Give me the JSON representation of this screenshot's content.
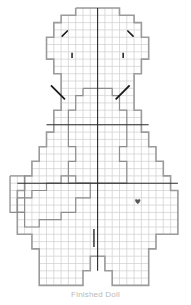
{
  "chart_data": {
    "type": "table",
    "subtitle": "",
    "xlabel": "",
    "ylabel": "",
    "grid": true,
    "legend_position": "none",
    "cell_width": 7.3,
    "cell_height": 7.3,
    "origin_x": 10.0,
    "origin_y": 8.0,
    "columns": 24,
    "rows": 40,
    "grid_line_color": "#cfcfcf",
    "outline_color": "#9b9b9b",
    "inner_line_color": "#8d8d8d",
    "symbol_color": "#1a1a1a",
    "heart_color": "#555555",
    "background_color": "#ffffff",
    "outlines": [
      {
        "name": "body-outline",
        "stroke": "#9b9b9b",
        "stroke_width": 1.6,
        "points": [
          [
            9,
            0
          ],
          [
            15,
            0
          ],
          [
            15,
            1
          ],
          [
            17,
            1
          ],
          [
            17,
            2
          ],
          [
            18,
            2
          ],
          [
            18,
            4
          ],
          [
            19,
            4
          ],
          [
            19,
            7
          ],
          [
            18,
            7
          ],
          [
            18,
            9
          ],
          [
            17,
            9
          ],
          [
            17,
            14
          ],
          [
            18,
            14
          ],
          [
            18,
            17
          ],
          [
            19,
            17
          ],
          [
            19,
            19
          ],
          [
            20,
            19
          ],
          [
            20,
            21
          ],
          [
            21,
            21
          ],
          [
            21,
            23
          ],
          [
            22,
            23
          ],
          [
            22,
            25
          ],
          [
            23,
            25
          ],
          [
            23,
            31
          ],
          [
            20,
            31
          ],
          [
            20,
            33
          ],
          [
            19,
            33
          ],
          [
            19,
            38
          ],
          [
            14,
            38
          ],
          [
            14,
            36
          ],
          [
            13,
            36
          ],
          [
            13,
            34
          ],
          [
            11,
            34
          ],
          [
            11,
            36
          ],
          [
            10,
            36
          ],
          [
            10,
            38
          ],
          [
            4,
            38
          ],
          [
            4,
            33
          ],
          [
            3,
            33
          ],
          [
            3,
            31
          ],
          [
            1,
            31
          ],
          [
            1,
            25
          ],
          [
            2,
            25
          ],
          [
            2,
            23
          ],
          [
            3,
            23
          ],
          [
            3,
            21
          ],
          [
            4,
            21
          ],
          [
            4,
            19
          ],
          [
            5,
            19
          ],
          [
            5,
            17
          ],
          [
            6,
            17
          ],
          [
            6,
            14
          ],
          [
            7,
            14
          ],
          [
            7,
            9
          ],
          [
            6,
            9
          ],
          [
            6,
            7
          ],
          [
            5,
            7
          ],
          [
            5,
            4
          ],
          [
            6,
            4
          ],
          [
            6,
            2
          ],
          [
            7,
            2
          ],
          [
            7,
            1
          ],
          [
            9,
            1
          ],
          [
            9,
            0
          ]
        ]
      },
      {
        "name": "inner-neck-outline",
        "stroke": "#8d8d8d",
        "stroke_width": 1.2,
        "points": [
          [
            10,
            11
          ],
          [
            14,
            11
          ],
          [
            14,
            12
          ],
          [
            15,
            12
          ],
          [
            15,
            14
          ],
          [
            16,
            14
          ],
          [
            16,
            19
          ],
          [
            15,
            19
          ],
          [
            15,
            21
          ],
          [
            16,
            21
          ],
          [
            16,
            24
          ],
          [
            8,
            24
          ],
          [
            8,
            21
          ],
          [
            9,
            21
          ],
          [
            9,
            19
          ],
          [
            8,
            19
          ],
          [
            8,
            14
          ],
          [
            9,
            14
          ],
          [
            9,
            12
          ],
          [
            10,
            12
          ],
          [
            10,
            11
          ]
        ]
      },
      {
        "name": "lower-left-notch-outline",
        "stroke": "#8d8d8d",
        "stroke_width": 1.2,
        "points": [
          [
            0,
            23
          ],
          [
            2,
            23
          ],
          [
            2,
            28
          ],
          [
            0,
            28
          ],
          [
            0,
            23
          ]
        ]
      },
      {
        "name": "inner-lower-outline",
        "stroke": "#8d8d8d",
        "stroke_width": 1.2,
        "points": [
          [
            1,
            26
          ],
          [
            3,
            26
          ],
          [
            3,
            25
          ],
          [
            5,
            25
          ],
          [
            5,
            24
          ],
          [
            7,
            24
          ],
          [
            7,
            23
          ],
          [
            9,
            23
          ],
          [
            9,
            24
          ],
          [
            11,
            24
          ],
          [
            11,
            26
          ],
          [
            9,
            26
          ],
          [
            9,
            28
          ],
          [
            7,
            28
          ],
          [
            7,
            29
          ],
          [
            4,
            29
          ],
          [
            4,
            30
          ],
          [
            2,
            30
          ],
          [
            2,
            28
          ],
          [
            1,
            28
          ],
          [
            1,
            26
          ]
        ]
      }
    ],
    "heavy_lines": [
      {
        "name": "center-vertical-line",
        "x1": 12,
        "y1": 0,
        "x2": 12,
        "y2": 36,
        "width": 1.1,
        "color": "#2a2a2a"
      },
      {
        "name": "horizontal-guide-upper",
        "x1": 5,
        "y1": 16,
        "x2": 19,
        "y2": 16,
        "width": 1.1,
        "color": "#2a2a2a"
      },
      {
        "name": "horizontal-guide-lower",
        "x1": 1,
        "y1": 24,
        "x2": 23,
        "y2": 24,
        "width": 1.1,
        "color": "#2a2a2a"
      }
    ],
    "symbols": [
      {
        "name": "decrease-left-top",
        "type": "diagonal-right",
        "col": 7,
        "row": 3
      },
      {
        "name": "decrease-right-top",
        "type": "diagonal-left",
        "col": 16,
        "row": 3
      },
      {
        "name": "tick-left",
        "type": "vertical-tick",
        "col": 8,
        "row": 6
      },
      {
        "name": "tick-right",
        "type": "vertical-tick",
        "col": 15,
        "row": 6
      },
      {
        "name": "decrease-left-long",
        "type": "diagonal-long-right",
        "col": 6,
        "row": 11
      },
      {
        "name": "decrease-right-long",
        "type": "diagonal-long-left",
        "col": 15,
        "row": 11
      },
      {
        "name": "heart-marker",
        "type": "heart",
        "col": 17,
        "row": 26
      },
      {
        "name": "vertical-bar-marker",
        "type": "vertical-bar",
        "col": 11,
        "row": 31
      }
    ],
    "caption": "Finished Doll"
  }
}
